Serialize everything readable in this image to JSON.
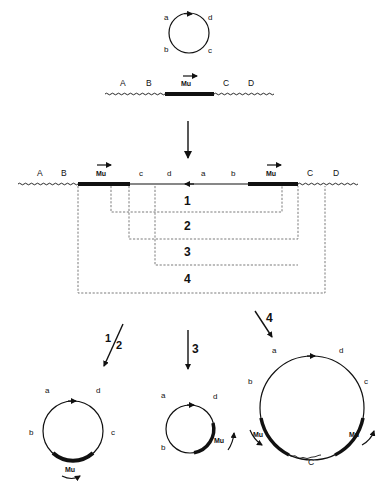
{
  "figure": {
    "top_plasmid": {
      "labels": {
        "a": "a",
        "b": "b",
        "c": "c",
        "d": "d"
      }
    },
    "host_chromosome": {
      "labels": {
        "A": "A",
        "B": "B",
        "C": "C",
        "D": "D"
      },
      "element": "Mu"
    },
    "cointegrate": {
      "labels": {
        "A": "A",
        "B": "B",
        "c": "c",
        "d": "d",
        "a": "a",
        "b": "b",
        "C": "C",
        "D": "D"
      },
      "element_left": "Mu",
      "element_right": "Mu"
    },
    "recombination_events": [
      {
        "label": "1"
      },
      {
        "label": "2"
      },
      {
        "label": "3"
      },
      {
        "label": "4"
      }
    ],
    "products": [
      {
        "step_label_num": "1",
        "step_label_den": "2",
        "labels": {
          "a": "a",
          "b": "b",
          "c": "c",
          "d": "d"
        },
        "element": "Mu"
      },
      {
        "step_label": "3",
        "labels": {
          "a": "a",
          "b": "b",
          "d": "d"
        },
        "element": "Mu"
      },
      {
        "step_label": "4",
        "labels": {
          "a": "a",
          "b": "b",
          "c": "c",
          "d": "d",
          "C": "C"
        },
        "element_left": "Mu",
        "element_right": "Mu"
      }
    ]
  }
}
